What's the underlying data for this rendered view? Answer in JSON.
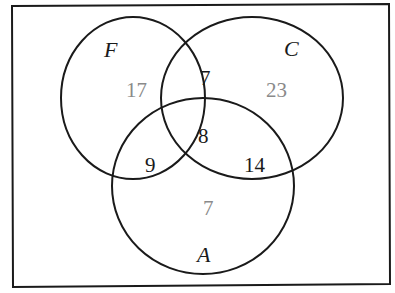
{
  "diagram": {
    "type": "venn",
    "sets": [
      {
        "id": "F",
        "label": "F"
      },
      {
        "id": "C",
        "label": "C"
      },
      {
        "id": "A",
        "label": "A"
      }
    ],
    "regions": {
      "F_only": "17",
      "C_only": "23",
      "A_only": "7",
      "F_and_C_only": "7",
      "F_and_A_only": "9",
      "C_and_A_only": "14",
      "F_and_C_and_A": "8"
    },
    "colors": {
      "stroke": "#1a1a1a",
      "exclusive_region_text": "#8a8a8a",
      "overlap_region_text": "#1a1a1a"
    }
  }
}
